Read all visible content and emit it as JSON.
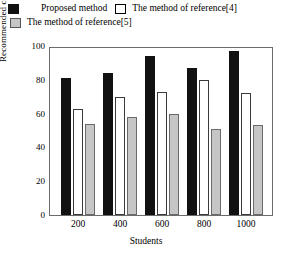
{
  "chart_data": {
    "type": "bar",
    "title": "",
    "xlabel": "Students",
    "ylabel": "Recommended coverage rate/%",
    "categories": [
      "200",
      "400",
      "600",
      "800",
      "1000"
    ],
    "ylim": [
      0,
      100
    ],
    "yticks": [
      0,
      20,
      40,
      60,
      80,
      100
    ],
    "grid": false,
    "legend_position": "top",
    "series": [
      {
        "name": "Proposed method",
        "color": "#111111",
        "values": [
          81,
          84,
          94,
          87,
          97
        ]
      },
      {
        "name": "The method of reference[4]",
        "color": "#ffffff",
        "values": [
          63,
          70,
          73,
          80,
          72
        ]
      },
      {
        "name": "The method of reference[5]",
        "color": "#c6c6c6",
        "values": [
          54,
          58,
          60,
          51,
          53
        ]
      }
    ]
  },
  "legend": {
    "items": [
      {
        "label": "Proposed method",
        "swatch": "black-swatch"
      },
      {
        "label": "The method of reference[4]",
        "swatch": "white-swatch"
      },
      {
        "label": "The method of reference[5]",
        "swatch": "gray-swatch"
      }
    ]
  },
  "axes": {
    "y_title": "Recommended coverage rate/%",
    "x_title": "Students",
    "y_ticks": [
      "100",
      "80",
      "60",
      "40",
      "20",
      "0"
    ],
    "x_ticks": [
      "200",
      "400",
      "600",
      "800",
      "1000"
    ]
  }
}
